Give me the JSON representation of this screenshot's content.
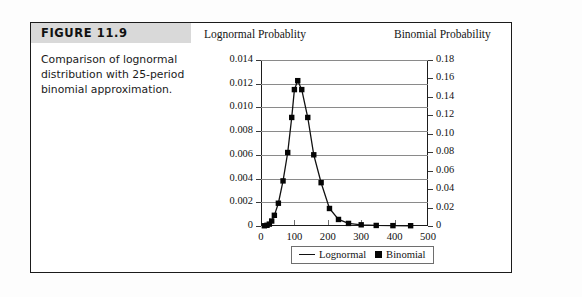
{
  "figure": {
    "label": "FIGURE 11.9",
    "caption": "Comparison of lognormal distribution with 25-period binomial approximation."
  },
  "legend": {
    "lognormal_label": "Lognormal",
    "binomial_label": "Binomial"
  },
  "chart_data": {
    "type": "line",
    "title": "",
    "left_axis_title": "Lognormal Probablity",
    "right_axis_title": "Binomial Probability",
    "xlabel": "",
    "xlim": [
      0,
      500
    ],
    "xticks": [
      0,
      100,
      200,
      300,
      400,
      500
    ],
    "xtick_labels": [
      "0",
      "100",
      "200",
      "300",
      "400",
      "500"
    ],
    "ylim": [
      0,
      0.014
    ],
    "yticks": [
      0,
      0.002,
      0.004,
      0.006,
      0.008,
      0.01,
      0.012,
      0.014
    ],
    "ytick_labels": [
      "0",
      "0.002",
      "0.004",
      "0.006",
      "0.008",
      "0.010",
      "0.012",
      "0.014"
    ],
    "ylim_right": [
      0,
      0.18
    ],
    "yticks_right": [
      0,
      0.02,
      0.04,
      0.06,
      0.08,
      0.1,
      0.12,
      0.14,
      0.16,
      0.18
    ],
    "ytick_labels_right": [
      "0",
      "0.02",
      "0.04",
      "0.06",
      "0.08",
      "0.10",
      "0.12",
      "0.14",
      "0.16",
      "0.18"
    ],
    "grid": true,
    "legend_position": "bottom-center",
    "series": [
      {
        "name": "Lognormal",
        "axis": "left",
        "style": "line",
        "color": "#111111",
        "x": [
          10,
          18,
          25,
          32,
          40,
          52,
          66,
          80,
          92,
          100,
          110,
          122,
          140,
          158,
          180,
          205,
          232,
          262,
          300,
          345,
          395,
          448
        ],
        "values": [
          2e-05,
          6e-05,
          0.00016,
          0.00042,
          0.0009,
          0.00192,
          0.0038,
          0.0062,
          0.00915,
          0.0115,
          0.01225,
          0.0115,
          0.00915,
          0.006,
          0.00365,
          0.00148,
          0.00055,
          0.00022,
          0.0001,
          5e-05,
          3e-05,
          2e-05
        ]
      },
      {
        "name": "Binomial",
        "axis": "right",
        "style": "marker",
        "color": "#050505",
        "x": [
          10,
          18,
          25,
          32,
          40,
          52,
          66,
          80,
          92,
          100,
          110,
          122,
          140,
          158,
          180,
          205,
          232,
          262,
          300,
          345,
          395,
          448
        ],
        "values": [
          0.00026,
          0.00077,
          0.00206,
          0.0054,
          0.0116,
          0.0247,
          0.0489,
          0.0797,
          0.1177,
          0.1479,
          0.1576,
          0.1479,
          0.1177,
          0.0772,
          0.047,
          0.019,
          0.0071,
          0.0028,
          0.0013,
          0.0006,
          0.0004,
          0.0003
        ]
      }
    ]
  }
}
